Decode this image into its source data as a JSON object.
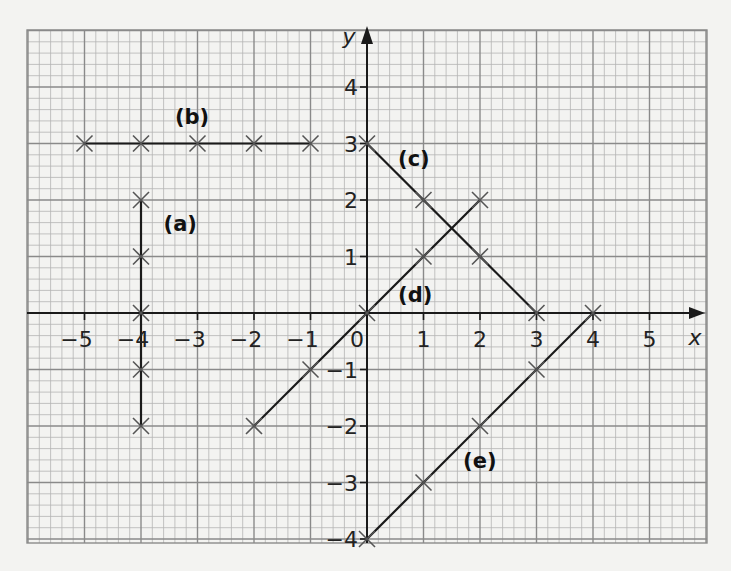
{
  "chart_data": {
    "type": "line",
    "title": "",
    "xlabel": "x",
    "ylabel": "y",
    "xlim": [
      -6,
      6
    ],
    "ylim": [
      -4,
      5
    ],
    "grid": true,
    "grid_minor_step": 0.2,
    "grid_major_step": 1,
    "x_ticks": [
      -5,
      -4,
      -3,
      -2,
      -1,
      0,
      1,
      2,
      3,
      4,
      5
    ],
    "x_tick_labels": [
      "−5",
      "−4",
      "−3",
      "−2",
      "−1",
      "0",
      "1",
      "2",
      "3",
      "4",
      "5"
    ],
    "y_ticks": [
      -4,
      -3,
      -2,
      -1,
      1,
      2,
      3,
      4
    ],
    "y_tick_labels": [
      "−4",
      "−3",
      "−2",
      "−1",
      "1",
      "2",
      "3",
      "4"
    ],
    "legend": null,
    "series": [
      {
        "name": "(a)",
        "label": "(a)",
        "equation": "x = -4",
        "points": [
          [
            -4,
            2
          ],
          [
            -4,
            1
          ],
          [
            -4,
            0
          ],
          [
            -4,
            -1
          ],
          [
            -4,
            -2
          ]
        ],
        "label_pos": [
          -3.6,
          1.45
        ]
      },
      {
        "name": "(b)",
        "label": "(b)",
        "equation": "y = 3",
        "points": [
          [
            -5,
            3
          ],
          [
            -4,
            3
          ],
          [
            -3,
            3
          ],
          [
            -2,
            3
          ],
          [
            -1,
            3
          ]
        ],
        "label_pos": [
          -3.4,
          3.35
        ]
      },
      {
        "name": "(c)",
        "label": "(c)",
        "equation": "y = 3 - x",
        "points": [
          [
            0,
            3
          ],
          [
            1,
            2
          ],
          [
            2,
            1
          ],
          [
            3,
            0
          ]
        ],
        "label_pos": [
          0.55,
          2.6
        ]
      },
      {
        "name": "(d)",
        "label": "(d)",
        "equation": "y = x",
        "points": [
          [
            -2,
            -2
          ],
          [
            -1,
            -1
          ],
          [
            0,
            0
          ],
          [
            1,
            1
          ],
          [
            2,
            2
          ]
        ],
        "label_pos": [
          0.55,
          0.2
        ]
      },
      {
        "name": "(e)",
        "label": "(e)",
        "equation": "y = x - 4",
        "points": [
          [
            0,
            -4
          ],
          [
            1,
            -3
          ],
          [
            2,
            -2
          ],
          [
            3,
            -1
          ],
          [
            4,
            0
          ]
        ],
        "label_pos": [
          1.7,
          -2.75
        ]
      }
    ]
  },
  "colors": {
    "paper": "#f3f3f1",
    "grid_minor": "#b4b4b4",
    "grid_major": "#8a8a8a",
    "axis": "#1a1a1a",
    "line": "#1a1a1a",
    "cross": "#555555"
  }
}
